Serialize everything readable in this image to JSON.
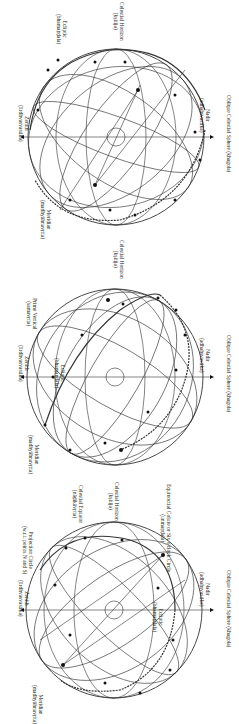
{
  "figure": {
    "orientation": "rotated 90 degrees clockwise",
    "panels": [
      {
        "id": "top",
        "axis_top": {
          "name": "Zenith",
          "term": "(ūrdhvasvastika)"
        },
        "axis_bottom": {
          "name": "Nadir",
          "term": "(adhaḥsvastika)"
        },
        "caption": "Oblique Celestial Sphere (khagola)",
        "labels": [
          {
            "name": "Ecliptic",
            "term": "(bhamaṇḍala)"
          },
          {
            "name": "Celestial Horizon",
            "term": "(kṣitija)"
          },
          {
            "name": "Meridian",
            "term": "(madhyāhnavṛtta)"
          }
        ],
        "center_label": "Ghaṭī 1",
        "points": [
          "AC",
          "DC",
          "MC",
          "IC",
          "NEP",
          "SEP",
          "I",
          "II",
          "III",
          "IV",
          "V",
          "VI",
          "VII",
          "VIII",
          "IX",
          "X",
          "XI",
          "XII",
          "W",
          "E",
          "N",
          "S"
        ]
      },
      {
        "id": "middle",
        "axis_top": {
          "name": "Zenith",
          "term": "(ūrdhvasvastika)"
        },
        "axis_bottom": {
          "name": "Nadir",
          "term": "(adhaḥsvastika)"
        },
        "caption": "Oblique Celestial Sphere (khagola)",
        "labels": [
          {
            "name": "Prime Vertical",
            "term": "(samavṛtta)"
          },
          {
            "name": "Ecliptic",
            "term": "(bhamaṇḍala)"
          },
          {
            "name": "Celestial Horizon",
            "term": "(kṣitija)"
          },
          {
            "name": "Meridian",
            "term": "(madhyāhnavṛtta)"
          }
        ],
        "center_label": "Ghaṭī 1",
        "points": [
          "AC",
          "DC",
          "I",
          "II",
          "III",
          "IV",
          "V",
          "VI",
          "VII",
          "VIII",
          "IX",
          "X",
          "XI",
          "XII",
          "E",
          "W"
        ]
      },
      {
        "id": "bottom",
        "axis_top": {
          "name": "Zenith",
          "term": "(ūrdhvasvastika)"
        },
        "axis_bottom": {
          "name": "Nadir",
          "term": "(adhaḥsvastika)"
        },
        "caption": "Oblique Celestial Sphere (khagola)",
        "labels": [
          {
            "name": "Projection Circle",
            "term": "(w.r.t. points N and S)"
          },
          {
            "name": "Celestial Equator",
            "term": "(nāḍikāvṛtta)"
          },
          {
            "name": "Celestial Horizon",
            "term": "(kṣitija)"
          },
          {
            "name": "Equinoctial Colure or Six o'clock Circle",
            "term": "(unmaṇḍala)"
          },
          {
            "name": "Ecliptic",
            "term": "(bhamaṇḍala)"
          },
          {
            "name": "Meridian",
            "term": "(madhyāhnavṛtta)"
          }
        ],
        "center_label": "Ghaṭī 1",
        "points": [
          "AC",
          "DC",
          "MC",
          "IC",
          "NCP",
          "SCP",
          "I",
          "II",
          "III",
          "IV",
          "V",
          "VI",
          "VII",
          "VIII",
          "IX",
          "X",
          "XI",
          "XII",
          "W",
          "E",
          "N",
          "S"
        ]
      }
    ]
  }
}
